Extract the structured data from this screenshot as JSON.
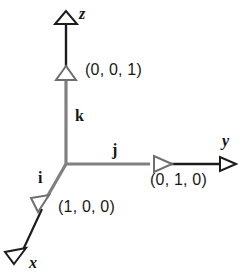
{
  "figure": {
    "type": "3d-axes-unit-vectors",
    "background_color": "#ffffff",
    "origin": {
      "x": 66,
      "y": 164
    },
    "colors": {
      "axis_black": "#141414",
      "unit_segment_gray": "#808080",
      "label_text": "#181818"
    }
  },
  "axes": [
    {
      "id": "z",
      "name": "z",
      "direction": "up",
      "tip": {
        "x": 66,
        "y": 20
      },
      "unit_point": {
        "x": 66,
        "y": 76
      },
      "unit_label": "(0, 0, 1)",
      "unit_vector_name": "k"
    },
    {
      "id": "y",
      "name": "y",
      "direction": "right",
      "tip": {
        "x": 228,
        "y": 164
      },
      "unit_point": {
        "x": 160,
        "y": 164
      },
      "unit_label": "(0, 1, 0)",
      "unit_vector_name": "j"
    },
    {
      "id": "x",
      "name": "x",
      "direction": "down-left",
      "tip": {
        "x": 18,
        "y": 258
      },
      "unit_point": {
        "x": 43,
        "y": 203
      },
      "unit_label": "(1, 0, 0)",
      "unit_vector_name": "i"
    }
  ],
  "labels": {
    "axis_z": "z",
    "axis_y": "y",
    "axis_x": "x",
    "unit_k": "k",
    "unit_j": "j",
    "unit_i": "i",
    "coord_z": "(0, 0, 1)",
    "coord_y": "(0, 1, 0)",
    "coord_x": "(1, 0, 0)"
  }
}
